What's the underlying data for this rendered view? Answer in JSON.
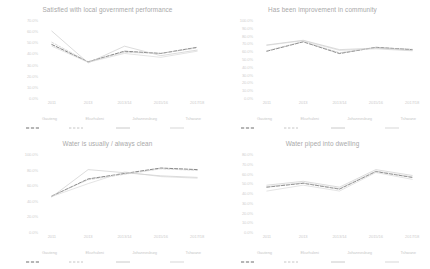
{
  "chart_data": [
    {
      "type": "line",
      "title": "Satisfied with local government performance",
      "xlabel": "",
      "ylabel": "",
      "grid": false,
      "legend_position": "bottom",
      "categories": [
        "2011",
        "2013",
        "2013/14",
        "2015/16",
        "2017/18"
      ],
      "ylim": [
        0,
        70
      ],
      "yticks": [
        "70.0%",
        "60.0%",
        "50.0%",
        "40.0%",
        "30.0%",
        "20.0%",
        "10.0%",
        "0.0%"
      ],
      "series": [
        {
          "name": "Gauteng",
          "style": "dashed",
          "values": [
            48.0,
            32.5,
            42.0,
            40.0,
            45.5
          ]
        },
        {
          "name": "Ekurhuleni",
          "style": "dashed-light",
          "values": [
            50.0,
            32.5,
            41.0,
            40.0,
            45.0
          ]
        },
        {
          "name": "Johannesburg",
          "style": "solid",
          "values": [
            60.0,
            31.5,
            46.5,
            38.0,
            43.0
          ]
        },
        {
          "name": "Tshwane",
          "style": "solid-light",
          "values": [
            46.5,
            32.0,
            40.0,
            36.5,
            42.0
          ]
        }
      ]
    },
    {
      "type": "line",
      "title": "Has been improvement in community",
      "xlabel": "",
      "ylabel": "",
      "grid": false,
      "legend_position": "bottom",
      "categories": [
        "2011",
        "2013",
        "2013/14",
        "2015/16",
        "2017/18"
      ],
      "ylim": [
        0,
        100
      ],
      "yticks": [
        "100.0%",
        "90.0%",
        "80.0%",
        "70.0%",
        "60.0%",
        "50.0%",
        "40.0%",
        "30.0%",
        "20.0%",
        "10.0%",
        "0.0%"
      ],
      "series": [
        {
          "name": "Gauteng",
          "style": "dashed",
          "values": [
            60.0,
            72.0,
            57.0,
            65.0,
            62.0
          ]
        },
        {
          "name": "Ekurhuleni",
          "style": "dashed-light",
          "values": [
            60.5,
            72.5,
            58.0,
            64.5,
            62.5
          ]
        },
        {
          "name": "Johannesburg",
          "style": "solid",
          "values": [
            68.0,
            74.0,
            62.0,
            64.0,
            61.0
          ]
        },
        {
          "name": "Tshwane",
          "style": "solid-light",
          "values": [
            67.5,
            73.5,
            61.0,
            63.0,
            60.5
          ]
        }
      ]
    },
    {
      "type": "line",
      "title": "Water is usually / always clean",
      "xlabel": "",
      "ylabel": "",
      "grid": false,
      "legend_position": "bottom",
      "categories": [
        "2011",
        "2013",
        "2013/14",
        "2015/16",
        "2017/18"
      ],
      "ylim": [
        0,
        100
      ],
      "yticks": [
        "100.0%",
        "80.0%",
        "60.0%",
        "40.0%",
        "20.0%",
        "0.0%"
      ],
      "series": [
        {
          "name": "Gauteng",
          "style": "dashed",
          "values": [
            46.0,
            68.0,
            75.0,
            82.0,
            80.0
          ]
        },
        {
          "name": "Ekurhuleni",
          "style": "dashed-light",
          "values": [
            46.5,
            67.0,
            74.0,
            81.0,
            79.0
          ]
        },
        {
          "name": "Johannesburg",
          "style": "solid",
          "values": [
            45.0,
            80.0,
            76.0,
            72.0,
            70.0
          ]
        },
        {
          "name": "Tshwane",
          "style": "solid-light",
          "values": [
            45.5,
            62.0,
            77.0,
            71.0,
            69.0
          ]
        }
      ]
    },
    {
      "type": "line",
      "title": "Water piped into dwelling",
      "xlabel": "",
      "ylabel": "",
      "grid": false,
      "legend_position": "bottom",
      "categories": [
        "2011",
        "2013",
        "2013/14",
        "2015/16",
        "2017/18"
      ],
      "ylim": [
        0,
        80
      ],
      "yticks": [
        "80.0%",
        "70.0%",
        "60.0%",
        "50.0%",
        "40.0%",
        "30.0%",
        "20.0%",
        "10.0%",
        "0.0%"
      ],
      "series": [
        {
          "name": "Gauteng",
          "style": "dashed",
          "values": [
            46.0,
            50.0,
            44.0,
            62.0,
            56.0
          ]
        },
        {
          "name": "Ekurhuleni",
          "style": "dashed-light",
          "values": [
            46.5,
            50.5,
            44.5,
            62.5,
            56.5
          ]
        },
        {
          "name": "Johannesburg",
          "style": "solid",
          "values": [
            48.0,
            52.0,
            46.0,
            64.0,
            58.0
          ]
        },
        {
          "name": "Tshwane",
          "style": "solid-light",
          "values": [
            42.0,
            48.0,
            42.0,
            61.0,
            54.0
          ]
        }
      ]
    }
  ],
  "colors": {
    "series_gauteng": "#6e6e6e",
    "series_ekurhuleni": "#bfbfbf",
    "series_johannesburg": "#c4c4c4",
    "series_tshwane": "#d2d2d2",
    "title": "#a9a9a9",
    "tick": "#cdcdcd",
    "background": "#ffffff"
  }
}
